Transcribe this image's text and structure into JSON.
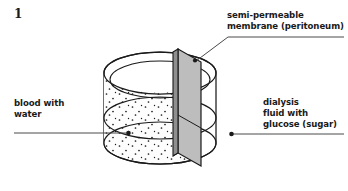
{
  "figure": {
    "number": "1",
    "caption_membrane": "semi-permeable\nmembrane (peritoneum)",
    "caption_blood": "blood with\nwater",
    "caption_dialysis": "dialysis\nfluid with\nglucose (sugar)"
  },
  "colors": {
    "stroke": "#1a1a1a",
    "membrane_fill": "#bdbdbd",
    "membrane_edge_fill": "#8f8f8f",
    "vessel_fill": "#fdfdfd",
    "dot": "#1a1a1a",
    "leader": "#4a4a4a",
    "text": "#1a1a1a",
    "background": "#ffffff"
  },
  "icons": {
    "membrane_marker": "dot-marker-icon",
    "blood_marker": "dot-marker-icon",
    "dialysis_marker": "dot-marker-icon"
  },
  "diagram": {
    "type": "labelled-science-diagram",
    "parts": [
      "cylinder vessel",
      "semi-permeable membrane divider",
      "blood compartment with particles",
      "dialysis fluid compartment"
    ]
  }
}
